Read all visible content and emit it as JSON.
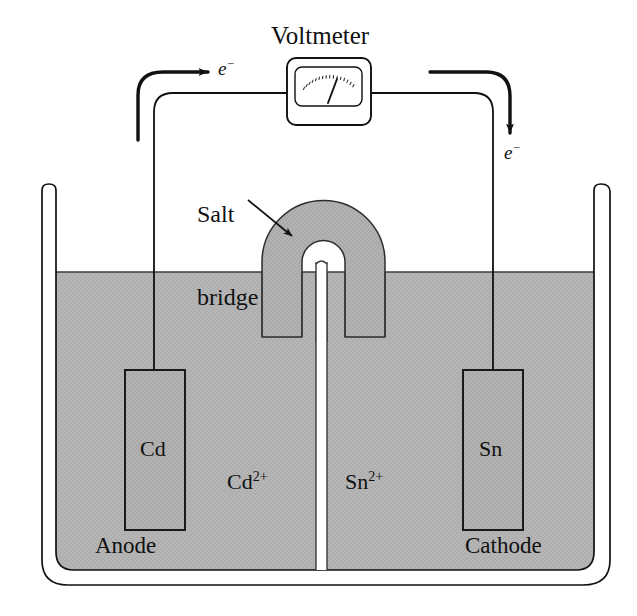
{
  "figure": {
    "labels": {
      "voltmeter": "Voltmeter",
      "salt_bridge_line1": "Salt",
      "salt_bridge_line2": "bridge",
      "electron_left": "e−",
      "electron_right": "e−",
      "anode_electrode": "Cd",
      "cathode_electrode": "Sn",
      "anode": "Anode",
      "cathode": "Cathode",
      "cation_left": "Cd2+",
      "cation_right": "Sn2+"
    },
    "cation_left_base": "Cd",
    "cation_left_charge": "2+",
    "cation_right_base": "Sn",
    "cation_right_charge": "2+",
    "electron_base": "e",
    "electron_charge": "−",
    "colors": {
      "line": "#111111",
      "solution_fill": "#b4b4b4",
      "salt_bridge_fill": "#b0b0b0",
      "electrode_fill": "#b0b0b0",
      "background": "#ffffff"
    },
    "geometry": {
      "beaker_outer_left": 42,
      "beaker_outer_right": 610,
      "beaker_inner_left": 56,
      "beaker_inner_right": 594,
      "beaker_top": 184,
      "beaker_bottom_inner": 570,
      "beaker_bottom_outer": 585,
      "liquid_level": 272,
      "divider_x": 321,
      "anode_electrode_box": [
        125,
        370,
        60,
        160
      ],
      "cathode_electrode_box": [
        463,
        370,
        60,
        160
      ],
      "voltmeter_box": [
        287,
        58,
        84,
        67
      ],
      "wire_y": 93,
      "wire_left_x": 154,
      "wire_right_x": 493
    }
  }
}
